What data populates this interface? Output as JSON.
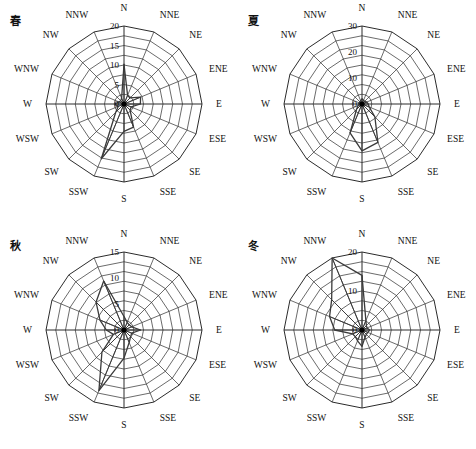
{
  "figure": {
    "title": "",
    "directions": [
      "N",
      "NNE",
      "NE",
      "ENE",
      "E",
      "ESE",
      "SE",
      "SSE",
      "S",
      "SSW",
      "SW",
      "WSW",
      "W",
      "WNW",
      "NW",
      "NNW"
    ]
  },
  "chart_data": [
    {
      "type": "line",
      "subtype": "wind-rose",
      "title": "春",
      "season_label": "春",
      "categories": [
        "N",
        "NNE",
        "NE",
        "ENE",
        "E",
        "ESE",
        "SE",
        "SSE",
        "S",
        "SSW",
        "SW",
        "WSW",
        "W",
        "WNW",
        "NW",
        "NNW"
      ],
      "values": [
        10.2,
        2.4,
        2.2,
        4.6,
        4.2,
        2.0,
        2.2,
        6.4,
        7.0,
        15.2,
        3.0,
        1.6,
        2.4,
        1.4,
        1.2,
        1.6
      ],
      "ticks": [
        0,
        5,
        10,
        15,
        20
      ],
      "tick_labels": [
        "0",
        "5",
        "10",
        "15",
        "20"
      ],
      "rlim": [
        0,
        20
      ],
      "xlabel": "",
      "ylabel": "",
      "grid": true,
      "legend": "none"
    },
    {
      "type": "line",
      "subtype": "wind-rose",
      "title": "夏",
      "season_label": "夏",
      "categories": [
        "N",
        "NNE",
        "NE",
        "ENE",
        "E",
        "ESE",
        "SE",
        "SSE",
        "S",
        "SSW",
        "SW",
        "WSW",
        "W",
        "WNW",
        "NW",
        "NNW"
      ],
      "values": [
        2.0,
        1.6,
        1.4,
        2.0,
        2.4,
        3.0,
        7.0,
        16.0,
        18.0,
        12.0,
        3.0,
        1.6,
        1.4,
        1.2,
        1.2,
        1.4
      ],
      "ticks": [
        0,
        10,
        20,
        30
      ],
      "tick_labels": [
        "0",
        "10",
        "20",
        "30"
      ],
      "rlim": [
        0,
        30
      ],
      "xlabel": "",
      "ylabel": "",
      "grid": true,
      "legend": "none"
    },
    {
      "type": "line",
      "subtype": "wind-rose",
      "title": "秋",
      "season_label": "秋",
      "categories": [
        "N",
        "NNE",
        "NE",
        "ENE",
        "E",
        "ESE",
        "SE",
        "SSE",
        "S",
        "SSW",
        "SW",
        "WSW",
        "W",
        "WNW",
        "NW",
        "NNW"
      ],
      "values": [
        2.6,
        1.6,
        1.4,
        1.6,
        3.2,
        1.6,
        1.8,
        2.6,
        5.4,
        12.6,
        6.0,
        2.2,
        3.4,
        5.0,
        7.6,
        10.2
      ],
      "ticks": [
        0,
        5,
        10,
        15
      ],
      "tick_labels": [
        "0",
        "5",
        "10",
        "15"
      ],
      "rlim": [
        0,
        15
      ],
      "xlabel": "",
      "ylabel": "",
      "grid": true,
      "legend": "none"
    },
    {
      "type": "line",
      "subtype": "wind-rose",
      "title": "冬",
      "season_label": "冬",
      "categories": [
        "N",
        "NNE",
        "NE",
        "ENE",
        "E",
        "ESE",
        "SE",
        "SSE",
        "S",
        "SSW",
        "SW",
        "WSW",
        "W",
        "WNW",
        "NW",
        "NNW"
      ],
      "values": [
        14.0,
        2.6,
        1.6,
        1.4,
        2.0,
        1.6,
        1.6,
        2.0,
        4.2,
        3.0,
        2.4,
        2.6,
        7.0,
        9.0,
        11.0,
        20.0
      ],
      "ticks": [
        0,
        10,
        20
      ],
      "tick_labels": [
        "0",
        "10",
        "20"
      ],
      "rlim": [
        0,
        20
      ],
      "xlabel": "",
      "ylabel": "",
      "grid": true,
      "legend": "none"
    }
  ]
}
